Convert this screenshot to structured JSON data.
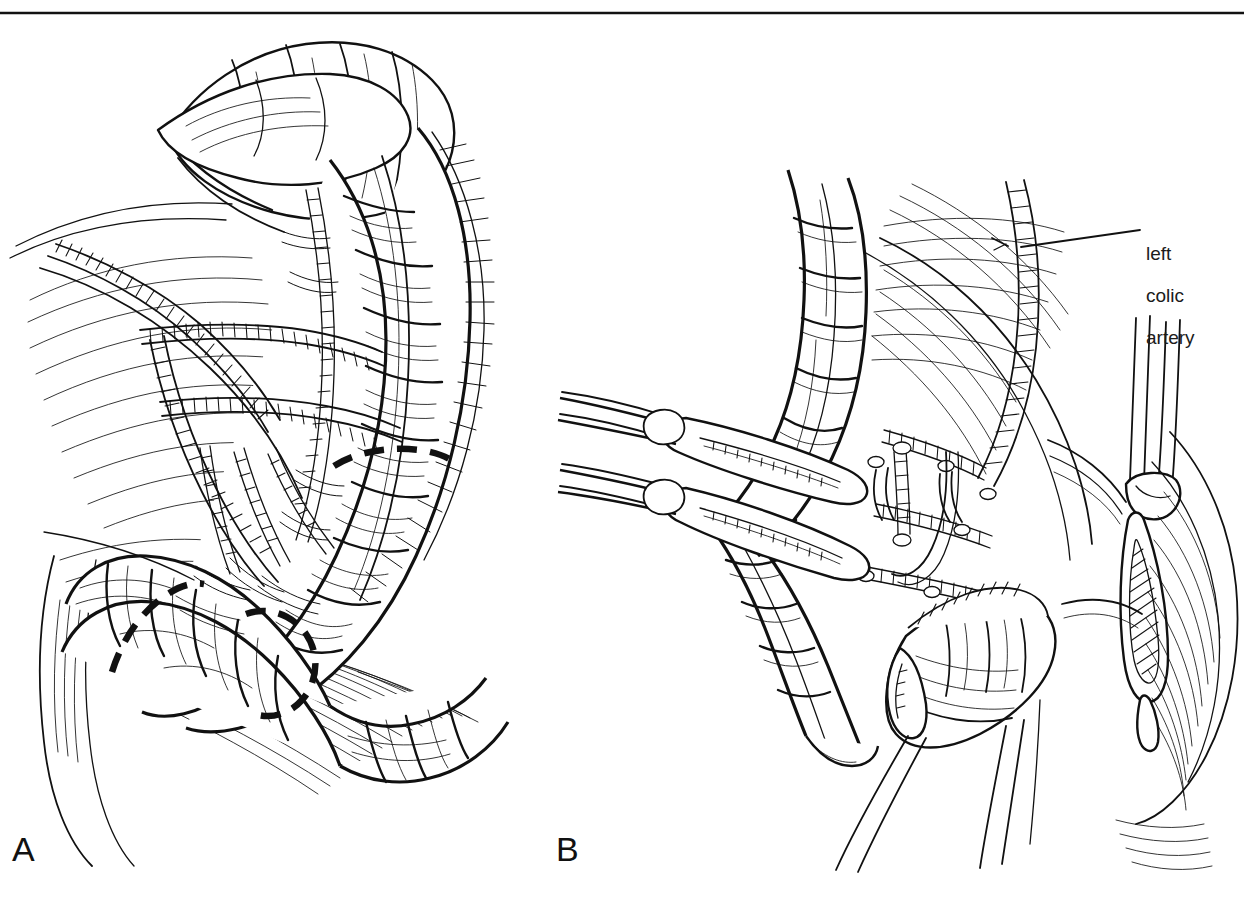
{
  "figure": {
    "kind": "surgical-line-art-illustration",
    "top_rule_color": "#1a1a1a",
    "ink_color": "#111111",
    "background_color": "#ffffff",
    "panels": [
      {
        "id": "A",
        "letter": "A",
        "caption": "",
        "description": "Mobilized left colon and splenic flexure with mesentery displayed; dashed lines mark the planned lines of bowel resection.",
        "annotations": []
      },
      {
        "id": "B",
        "letter": "B",
        "caption": "",
        "description": "Bowel divided between clamps; mesenteric vessels ligated and divided with the left colic artery identified.",
        "annotations": [
          {
            "id": "left-colic-artery",
            "text_lines": [
              "left",
              "colic",
              "artery"
            ],
            "text": "left colic artery",
            "leader_from": {
              "x": 1020,
              "y": 247
            },
            "leader_to": {
              "x": 1140,
              "y": 230
            }
          }
        ]
      }
    ]
  },
  "labels": {
    "panel_a": "A",
    "panel_b": "B",
    "left_colic_artery_line1": "left",
    "left_colic_artery_line2": "colic",
    "left_colic_artery_line3": "artery"
  },
  "icons": {
    "panel_a_marker": "letter-a-icon",
    "panel_b_marker": "letter-b-icon",
    "leader_line": "leader-line-icon"
  }
}
